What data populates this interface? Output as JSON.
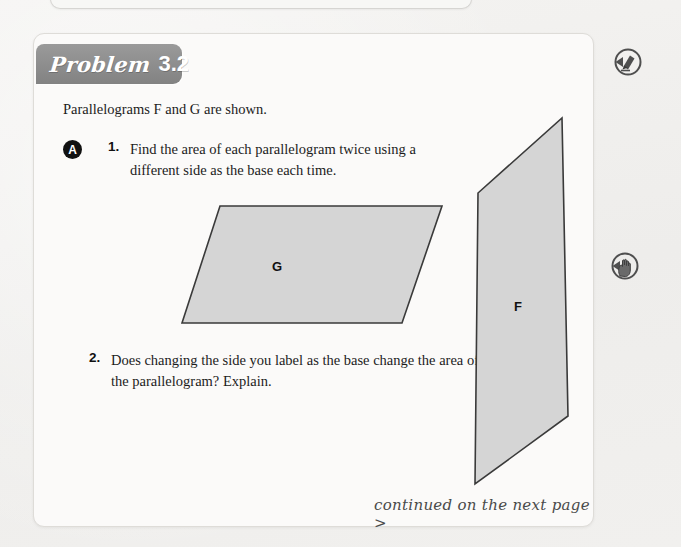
{
  "page": {
    "background_color": "#f2f1ef",
    "card_background": "#fbfaf9"
  },
  "banner": {
    "word": "Problem",
    "number": "3.2",
    "color": "#8d8d8d"
  },
  "content": {
    "intro": "Parallelograms F and G are shown.",
    "part_label": "A",
    "questions": [
      {
        "number": "1.",
        "text": "Find the area of each parallelogram twice using a different side as the base each time."
      },
      {
        "number": "2.",
        "text": "Does changing the side you label as the base change the area of the parallelogram? Explain."
      }
    ]
  },
  "figures": {
    "fill_color": "#d5d5d5",
    "stroke_color": "#3a3a3a",
    "parallelogram_g": {
      "label": "G",
      "points": "186,172 408,172 368,289 148,289"
    },
    "parallelogram_f": {
      "label": "F",
      "points": "528,84 534,382 441,450 444,159"
    }
  },
  "footer": {
    "continued": "continued on the next page >"
  },
  "margin_icons": [
    {
      "name": "pencil-icon",
      "title": "pencil"
    },
    {
      "name": "hand-icon",
      "title": "hand"
    }
  ]
}
